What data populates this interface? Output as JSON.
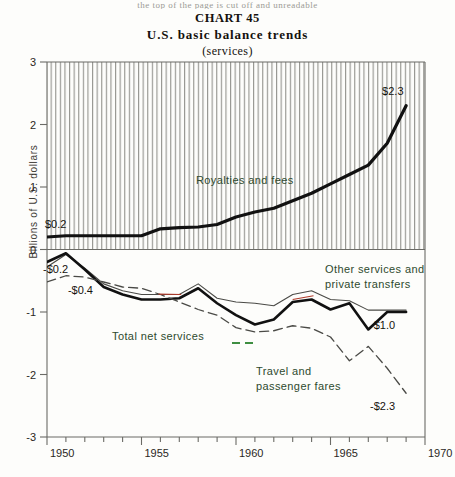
{
  "page": {
    "cutoff_text": "the top of the page is cut off and unreadable"
  },
  "title": {
    "chart_number": "CHART 45",
    "main": "U.S. basic balance trends",
    "subtitle": "(services)"
  },
  "axes": {
    "y_label": "Billions of U.S. dollars",
    "y_ticks": [
      "3",
      "2",
      "1",
      "0",
      "-1",
      "-2",
      "-3"
    ],
    "y_values": [
      3,
      2,
      1,
      0,
      -1,
      -2,
      -3
    ],
    "x_ticks": [
      "1950",
      "1955",
      "1960",
      "1965",
      "1970"
    ],
    "x_values": [
      1950,
      1955,
      1960,
      1965,
      1970
    ],
    "x_minor_step": 1
  },
  "value_labels": [
    {
      "name": "royalties-start-label",
      "text": "$0.2",
      "x": 1950,
      "y": 0.2,
      "dx": -2,
      "dy": -9
    },
    {
      "name": "royalties-end-label",
      "text": "$2.3",
      "x": 1969,
      "y": 2.3,
      "dx": -24,
      "dy": -11
    },
    {
      "name": "total-start-label",
      "text": "-$0.2",
      "x": 1950,
      "y": -0.2,
      "dx": -4,
      "dy": 11
    },
    {
      "name": "travel-start-label",
      "text": "-$0.4",
      "x": 1951,
      "y": -0.42,
      "dx": 2,
      "dy": 18
    },
    {
      "name": "total-end-label",
      "text": "-$1.0",
      "x": 1969,
      "y": -1.0,
      "dx": -36,
      "dy": 17
    },
    {
      "name": "travel-end-label",
      "text": "-$2.3",
      "x": 1969,
      "y": -2.3,
      "dx": -36,
      "dy": 17
    }
  ],
  "annotations": [
    {
      "name": "annotation-royalties",
      "lines": [
        "Royalties and fees"
      ],
      "x": 196,
      "y": 184,
      "color": "#22301f"
    },
    {
      "name": "annotation-other-services",
      "lines": [
        "Other services and",
        "private transfers"
      ],
      "x": 325,
      "y": 273,
      "color": "#2e4a2e"
    },
    {
      "name": "annotation-total-net",
      "lines": [
        "Total net services"
      ],
      "x": 112,
      "y": 340,
      "color": "#2e4a2e"
    },
    {
      "name": "annotation-travel",
      "lines": [
        "Travel and",
        "passenger fares"
      ],
      "x": 256,
      "y": 375,
      "color": "#2e4a2e"
    }
  ],
  "colors": {
    "axis": "#6b6b66",
    "hatch": "#8d8d88",
    "total_net_services": "#111111",
    "other_services": "#4a4a46",
    "travel_fares": "#4a4a46",
    "leader_green": "#3e8e41",
    "accent_red": "#b03a2a",
    "background": "#fdfdfb"
  },
  "chart_data": {
    "type": "line",
    "subtitle": "(services)",
    "xlabel": "",
    "ylabel": "Billions of U.S. dollars",
    "xlim": [
      1950,
      1970
    ],
    "ylim": [
      -3,
      3
    ],
    "grid": "vertical hatch shading in upper (positive) panel only",
    "legend": "inline annotations on the plot",
    "x": [
      1950,
      1951,
      1952,
      1953,
      1954,
      1955,
      1956,
      1957,
      1958,
      1959,
      1960,
      1961,
      1962,
      1963,
      1964,
      1965,
      1966,
      1967,
      1968,
      1969
    ],
    "series": [
      {
        "name": "Royalties and fees",
        "style": "thick solid black",
        "values": [
          0.2,
          0.22,
          0.22,
          0.22,
          0.22,
          0.22,
          0.33,
          0.35,
          0.36,
          0.4,
          0.52,
          0.6,
          0.66,
          0.78,
          0.9,
          1.05,
          1.2,
          1.35,
          1.7,
          2.3
        ],
        "labels": {
          "start": "$0.2",
          "end": "$2.3"
        }
      },
      {
        "name": "Other services and private transfers",
        "style": "thin solid",
        "values": [
          -0.28,
          -0.08,
          -0.3,
          -0.55,
          -0.66,
          -0.72,
          -0.72,
          -0.72,
          -0.55,
          -0.78,
          -0.84,
          -0.86,
          -0.9,
          -0.72,
          -0.66,
          -0.8,
          -0.82,
          -0.97,
          -0.97,
          -0.97
        ]
      },
      {
        "name": "Total net services",
        "style": "thick solid black",
        "values": [
          -0.2,
          -0.06,
          -0.32,
          -0.6,
          -0.72,
          -0.8,
          -0.8,
          -0.78,
          -0.62,
          -0.86,
          -1.05,
          -1.2,
          -1.12,
          -0.84,
          -0.8,
          -0.96,
          -0.86,
          -1.28,
          -1.0,
          -1.0
        ],
        "labels": {
          "start": "-$0.2",
          "end": "-$1.0"
        }
      },
      {
        "name": "Travel and passenger fares",
        "style": "dashed",
        "values": [
          -0.52,
          -0.42,
          -0.44,
          -0.52,
          -0.6,
          -0.62,
          -0.72,
          -0.84,
          -0.96,
          -1.05,
          -1.25,
          -1.32,
          -1.3,
          -1.22,
          -1.26,
          -1.4,
          -1.78,
          -1.55,
          -1.9,
          -2.3
        ],
        "labels": {
          "start": "-$0.4",
          "end": "-$2.3"
        }
      }
    ]
  }
}
